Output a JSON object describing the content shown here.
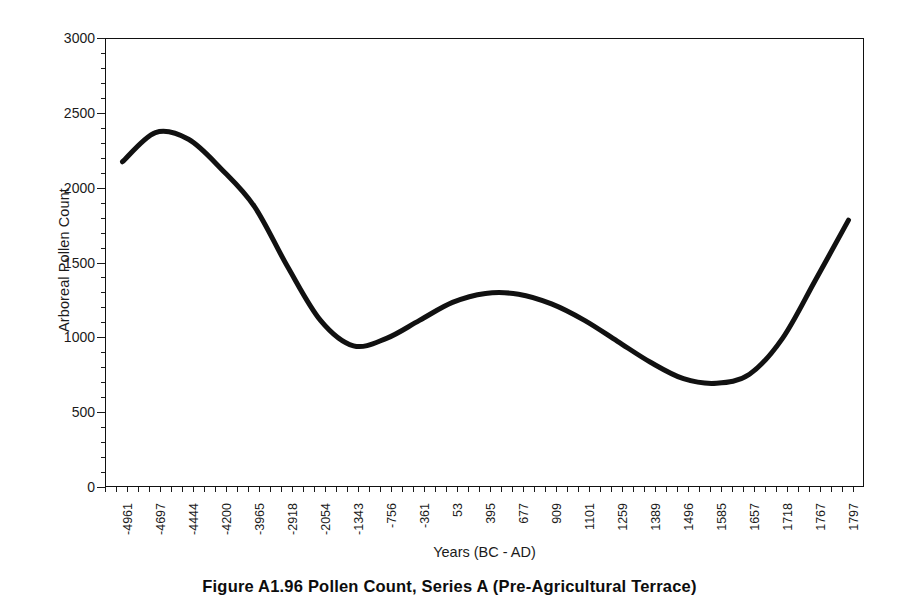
{
  "figure": {
    "caption": "Figure A1.96     Pollen Count, Series A (Pre-Agricultural Terrace)"
  },
  "chart_data": {
    "type": "line",
    "title": "",
    "subtitle": "",
    "xlabel": "Years (BC - AD)",
    "ylabel": "Arboreal Pollen Count",
    "grid": false,
    "legend": false,
    "legend_position": "none",
    "line_color": "#111111",
    "line_width": 5,
    "ylim": [
      0,
      3000
    ],
    "y_ticks": [
      0,
      500,
      1000,
      1500,
      2000,
      2500,
      3000
    ],
    "y_tick_labels": [
      "0",
      "500",
      "1000",
      "1500",
      "2000",
      "2500",
      "3000"
    ],
    "x_minor_ticks_per_major": 3,
    "categories": [
      "-4961",
      "-4697",
      "-4444",
      "-4200",
      "-3965",
      "-2918",
      "-2054",
      "-1343",
      "-756",
      "-361",
      "53",
      "395",
      "677",
      "909",
      "1101",
      "1259",
      "1389",
      "1496",
      "1585",
      "1657",
      "1718",
      "1767",
      "1797"
    ],
    "x_tick_labels": [
      "-4961",
      "-4697",
      "-4444",
      "-4200",
      "-3965",
      "-2918",
      "-2054",
      "-1343",
      "-756",
      "-361",
      "53",
      "395",
      "677",
      "909",
      "1101",
      "1259",
      "1389",
      "1496",
      "1585",
      "1657",
      "1718",
      "1767",
      "1797"
    ],
    "values": [
      2180,
      2375,
      2330,
      2130,
      1880,
      1480,
      1120,
      950,
      1000,
      1120,
      1240,
      1300,
      1295,
      1230,
      1120,
      980,
      840,
      730,
      700,
      760,
      1000,
      1390,
      1790
    ],
    "series": [
      {
        "name": "Arboreal Pollen Count",
        "values": [
          2180,
          2375,
          2330,
          2130,
          1880,
          1480,
          1120,
          950,
          1000,
          1120,
          1240,
          1300,
          1295,
          1230,
          1120,
          980,
          840,
          730,
          700,
          760,
          1000,
          1390,
          1790
        ]
      }
    ],
    "annotations": []
  }
}
